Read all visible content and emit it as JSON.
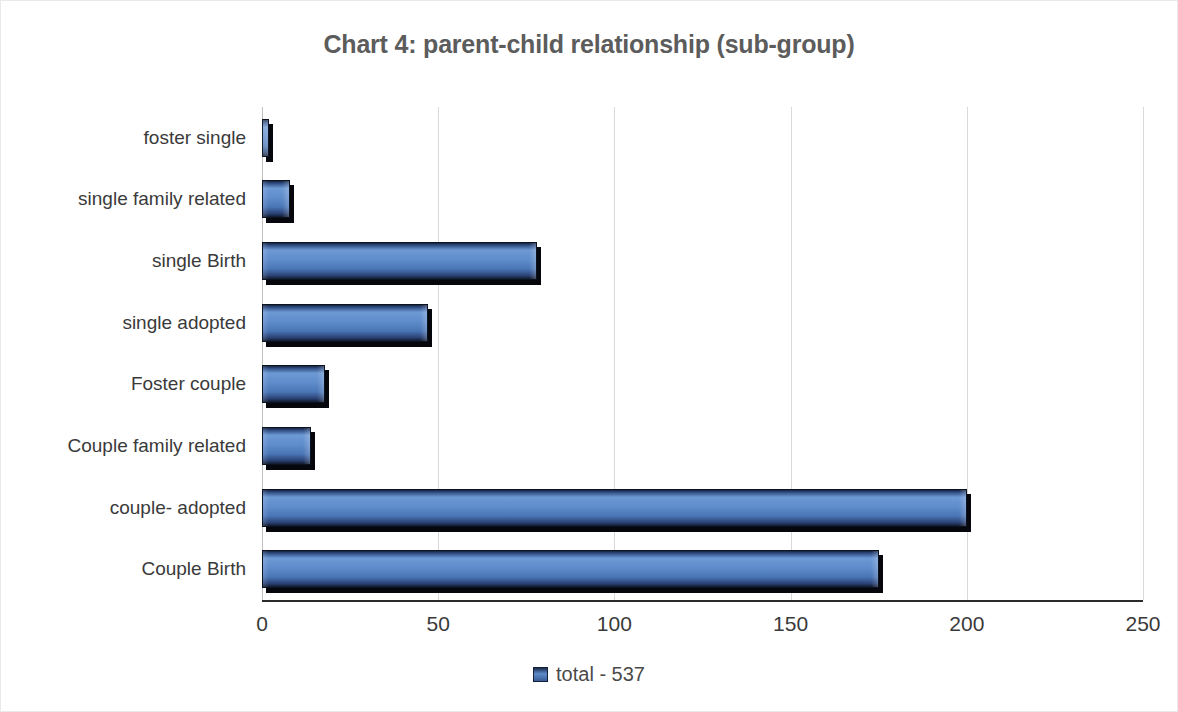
{
  "chart_data": {
    "type": "bar",
    "orientation": "horizontal",
    "title": "Chart 4: parent-child relationship (sub-group)",
    "xlabel": "",
    "ylabel": "",
    "categories": [
      "foster single",
      "single family related",
      "single Birth",
      "single adopted",
      "Foster couple",
      "Couple family related",
      "couple- adopted",
      "Couple Birth"
    ],
    "values": [
      2,
      8,
      78,
      47,
      18,
      14,
      200,
      175
    ],
    "series": [
      {
        "name": "total - 537",
        "values": [
          2,
          8,
          78,
          47,
          18,
          14,
          200,
          175
        ]
      }
    ],
    "xlim": [
      0,
      250
    ],
    "xticks": [
      0,
      50,
      100,
      150,
      200,
      250
    ],
    "xtick_labels": [
      "0",
      "50",
      "100",
      "150",
      "200",
      "250"
    ],
    "grid": "vertical",
    "legend": {
      "position": "bottom",
      "entries": [
        "total - 537"
      ]
    },
    "colors": {
      "bar_light": "#6d99d4",
      "bar_mid": "#5f8ccb",
      "bar_dark": "#17223c",
      "shadow": "#05070c",
      "gridline": "#d9d9d9",
      "axis": "#2b2b2b",
      "title_text": "#5c5c5c",
      "label_text": "#3a3a3a"
    }
  },
  "legend_label": "total - 537"
}
